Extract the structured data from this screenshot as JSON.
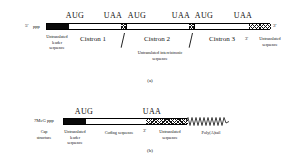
{
  "figure": {
    "title": "",
    "panels": [
      {
        "id": "a",
        "id_label": "(a)",
        "type": "polycistronic-mrna",
        "left_end": "5'",
        "left_end_modifier": "ppp",
        "right_end": "3'",
        "codons": [
          {
            "text": "AUG",
            "x": 75
          },
          {
            "text": "UAA",
            "x": 113
          },
          {
            "text": "AUG",
            "x": 137
          },
          {
            "text": "UAA",
            "x": 181
          },
          {
            "text": "AUG",
            "x": 204
          },
          {
            "text": "UAA",
            "x": 243
          }
        ],
        "segments": [
          {
            "name": "untranslated-leader",
            "fill": "black",
            "x": 46,
            "w": 22
          },
          {
            "name": "cistron-1",
            "fill": "open",
            "x": 68,
            "w": 52
          },
          {
            "name": "intercistronic-1",
            "fill": "hatch",
            "x": 120,
            "w": 6
          },
          {
            "name": "cistron-2",
            "fill": "open",
            "x": 126,
            "w": 62
          },
          {
            "name": "intercistronic-2",
            "fill": "hatch",
            "x": 188,
            "w": 6
          },
          {
            "name": "cistron-3",
            "fill": "open",
            "x": 194,
            "w": 54
          },
          {
            "name": "untranslated-3prime",
            "fill": "hatch",
            "x": 248,
            "w": 22
          }
        ],
        "labels": [
          {
            "name": "untranslated-leader-label",
            "text": "Untranslated\nleader\nsequence",
            "x": 57,
            "y": 35
          },
          {
            "name": "cistron-1-label",
            "text": "Cistron 1",
            "x": 93,
            "y": 37
          },
          {
            "name": "cistron-2-label",
            "text": "Cistron 2",
            "x": 157,
            "y": 37
          },
          {
            "name": "cistron-3-label",
            "text": "Cistron 3",
            "x": 222,
            "y": 37
          },
          {
            "name": "intercistronic-label",
            "text": "Untranslated intercistronic\nsequence",
            "x": 160,
            "y": 52
          },
          {
            "name": "three-prime-marker",
            "text": "3'",
            "x": 247,
            "y": 38
          },
          {
            "name": "untranslated-3prime-label",
            "text": "Untranslated\nsequence",
            "x": 268,
            "y": 36
          }
        ]
      },
      {
        "id": "b",
        "id_label": "(b)",
        "type": "monocistronic-mrna",
        "left_end_modifier": "7MeG ppp",
        "codons": [
          {
            "text": "AUG",
            "x": 84
          },
          {
            "text": "UAA",
            "x": 152
          }
        ],
        "segments": [
          {
            "name": "untranslated-leader",
            "fill": "black",
            "x": 63,
            "w": 22
          },
          {
            "name": "coding-sequence",
            "fill": "open",
            "x": 85,
            "w": 60
          },
          {
            "name": "untranslated-3prime",
            "fill": "hatch",
            "x": 145,
            "w": 42
          }
        ],
        "polya": {
          "name": "poly-a-tail",
          "x": 187,
          "w": 42
        },
        "labels": [
          {
            "name": "cap-structure-label",
            "text": "Cap\nstructure",
            "x": 44,
            "y": 130
          },
          {
            "name": "untranslated-leader-label",
            "text": "Untranslated\nleader\nsequence",
            "x": 75,
            "y": 130
          },
          {
            "name": "coding-sequence-label",
            "text": "Coding sequence",
            "x": 119,
            "y": 131
          },
          {
            "name": "three-prime-marker",
            "text": "3'",
            "x": 145,
            "y": 131
          },
          {
            "name": "untranslated-3prime-label",
            "text": "Untranslated\nsequence",
            "x": 167,
            "y": 130
          },
          {
            "name": "poly-a-tail-label",
            "text": "Poly(A)tail",
            "x": 208,
            "y": 131
          }
        ]
      }
    ],
    "colors": {
      "ink": "#111111",
      "paper": "#ffffff",
      "fill_black": "#0a0a0a"
    }
  }
}
